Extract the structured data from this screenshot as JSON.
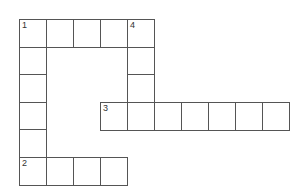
{
  "puzzle": {
    "type": "crossword",
    "cell_size": 27,
    "origin": {
      "x": 19,
      "y": 19
    },
    "cells": [
      {
        "col": 0,
        "row": 0,
        "num": "1"
      },
      {
        "col": 1,
        "row": 0
      },
      {
        "col": 2,
        "row": 0
      },
      {
        "col": 3,
        "row": 0
      },
      {
        "col": 4,
        "row": 0,
        "num": "4"
      },
      {
        "col": 0,
        "row": 1
      },
      {
        "col": 4,
        "row": 1
      },
      {
        "col": 0,
        "row": 2
      },
      {
        "col": 4,
        "row": 2
      },
      {
        "col": 0,
        "row": 3
      },
      {
        "col": 3,
        "row": 3,
        "num": "3"
      },
      {
        "col": 4,
        "row": 3
      },
      {
        "col": 5,
        "row": 3
      },
      {
        "col": 6,
        "row": 3
      },
      {
        "col": 7,
        "row": 3
      },
      {
        "col": 8,
        "row": 3
      },
      {
        "col": 9,
        "row": 3
      },
      {
        "col": 0,
        "row": 4
      },
      {
        "col": 0,
        "row": 5,
        "num": "2"
      },
      {
        "col": 1,
        "row": 5
      },
      {
        "col": 2,
        "row": 5
      },
      {
        "col": 3,
        "row": 5
      }
    ],
    "entries": [
      {
        "num": "1",
        "direction": "across",
        "length": 5
      },
      {
        "num": "1",
        "direction": "down",
        "length": 6
      },
      {
        "num": "2",
        "direction": "across",
        "length": 4
      },
      {
        "num": "3",
        "direction": "across",
        "length": 7
      },
      {
        "num": "4",
        "direction": "down",
        "length": 4
      }
    ]
  }
}
